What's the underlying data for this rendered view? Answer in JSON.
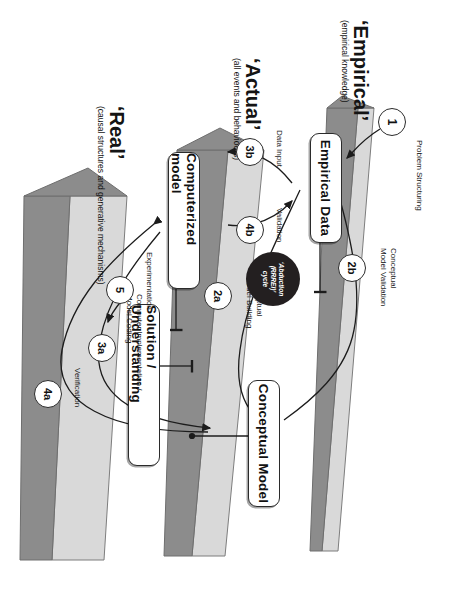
{
  "diagram": {
    "orientation": "rotated-90",
    "colors": {
      "prism_face": "#8c8c8c",
      "prism_edge": "#d9d9d9",
      "prism_outline": "#6e6e6e",
      "disc": "#231f20",
      "line": "#1c1c1c",
      "box_fill": "#ffffff",
      "text": "#141414"
    }
  },
  "strata": [
    {
      "id": "empirical",
      "title": "‘Empirical’",
      "subtitle": "(empirical knowledge)"
    },
    {
      "id": "actual",
      "title": "‘Actual’",
      "subtitle": "(all events and behaviours)"
    },
    {
      "id": "real",
      "title": "‘Real’",
      "subtitle": "(causal structures and generative mechanisms)"
    }
  ],
  "boxes": [
    {
      "id": "empirical-data",
      "label": "Empirical Data"
    },
    {
      "id": "computerized-model",
      "label": "Computerized model"
    },
    {
      "id": "solution-understanding",
      "label": "Solution / Understanding"
    },
    {
      "id": "conceptual-model",
      "label": "Conceptual Model"
    }
  ],
  "steps": [
    {
      "id": "1",
      "number": "1",
      "label": "Problem Structuring"
    },
    {
      "id": "2b",
      "number": "2b",
      "label": "Conceptual\nModel Validation"
    },
    {
      "id": "2a",
      "number": "2a",
      "label": "Conceptual\nModel Building"
    },
    {
      "id": "3b",
      "number": "3b",
      "label": "Data Input"
    },
    {
      "id": "4b",
      "number": "4b",
      "label": "Validation"
    },
    {
      "id": "3a",
      "number": "3a",
      "label": "Computer Implementation /\nModel Coding"
    },
    {
      "id": "4a",
      "number": "4a",
      "label": "Verification"
    },
    {
      "id": "5",
      "number": "5",
      "label": "Experimentation"
    }
  ],
  "cycle": {
    "line1": "‘Abduction",
    "line2": "(RRREI)’",
    "line3": "cycle"
  }
}
